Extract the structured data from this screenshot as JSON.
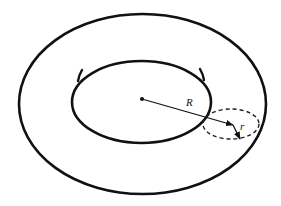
{
  "diagram": {
    "labels": {
      "major_radius": "R",
      "minor_radius": "r"
    },
    "colors": {
      "stroke": "#111111",
      "background": "#ffffff"
    },
    "elements": [
      "outer-boundary-ellipse",
      "inner-hole-ellipse",
      "center-point",
      "major-radius-arrow",
      "cross-section-dashed-ellipse",
      "minor-radius-arrow"
    ]
  }
}
